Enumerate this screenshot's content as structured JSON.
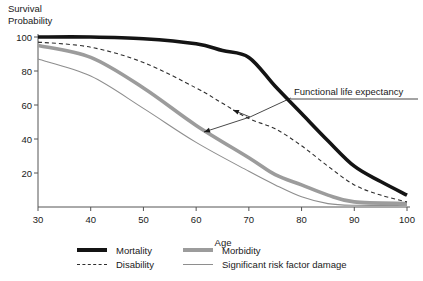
{
  "figure": {
    "y_axis_title_line1": "Survival",
    "y_axis_title_line2": "Probability",
    "x_axis_title": "Age",
    "background": "#ffffff"
  },
  "colors": {
    "axis": "#555555",
    "tick_label": "#1a1a1a",
    "annotation": "#1a1a1a"
  },
  "chart_data": {
    "type": "line",
    "title": "",
    "xlabel": "Age",
    "ylabel": "Survival Probability",
    "xlim": [
      30,
      100
    ],
    "ylim": [
      0,
      100
    ],
    "x_ticks": [
      30,
      40,
      50,
      60,
      70,
      80,
      90,
      100
    ],
    "y_ticks": [
      20,
      40,
      60,
      80,
      100
    ],
    "grid": false,
    "legend_position": "bottom",
    "series": [
      {
        "name": "Significant risk factor damage",
        "color": "#8e8e8e",
        "stroke_width": 1.1,
        "dash": null,
        "points": [
          [
            30,
            87
          ],
          [
            40,
            77
          ],
          [
            50,
            58
          ],
          [
            60,
            38
          ],
          [
            70,
            21
          ],
          [
            75,
            13
          ],
          [
            80,
            6
          ],
          [
            85,
            2
          ],
          [
            90,
            1
          ],
          [
            100,
            1
          ]
        ]
      },
      {
        "name": "Morbidity",
        "color": "#9c9c9c",
        "stroke_width": 3.6,
        "dash": null,
        "points": [
          [
            30,
            95
          ],
          [
            40,
            88
          ],
          [
            50,
            70
          ],
          [
            60,
            48
          ],
          [
            70,
            29
          ],
          [
            75,
            19
          ],
          [
            80,
            13
          ],
          [
            85,
            7
          ],
          [
            90,
            3
          ],
          [
            100,
            2
          ]
        ]
      },
      {
        "name": "Disability",
        "color": "#2e2e2e",
        "stroke_width": 1.1,
        "dash": "4,3",
        "points": [
          [
            30,
            97
          ],
          [
            40,
            94
          ],
          [
            50,
            85
          ],
          [
            60,
            70
          ],
          [
            65,
            61
          ],
          [
            70,
            52
          ],
          [
            75,
            46
          ],
          [
            80,
            36
          ],
          [
            85,
            24
          ],
          [
            90,
            13
          ],
          [
            95,
            7
          ],
          [
            100,
            3
          ]
        ]
      },
      {
        "name": "Mortality",
        "color": "#141414",
        "stroke_width": 3.6,
        "dash": null,
        "points": [
          [
            30,
            100
          ],
          [
            40,
            100
          ],
          [
            50,
            99
          ],
          [
            60,
            96
          ],
          [
            65,
            92
          ],
          [
            70,
            88
          ],
          [
            75,
            71
          ],
          [
            80,
            55
          ],
          [
            85,
            39
          ],
          [
            90,
            24
          ],
          [
            95,
            15
          ],
          [
            100,
            7
          ]
        ]
      }
    ],
    "annotation": {
      "text": "Functional life expectancy",
      "text_x": 294,
      "text_baseline_y": 95,
      "underline": {
        "x1": 291,
        "x2": 418,
        "y": 99
      },
      "leader": {
        "x1": 291,
        "y1": 98,
        "x2": 250,
        "y2": 117
      },
      "arrows": [
        {
          "x1": 250,
          "y1": 117,
          "x2": 233,
          "y2": 110
        },
        {
          "x1": 250,
          "y1": 117,
          "x2": 204,
          "y2": 132
        }
      ]
    }
  },
  "legend": {
    "columns": [
      {
        "items": [
          "Mortality",
          "Disability"
        ]
      },
      {
        "items": [
          "Morbidity",
          "Significant risk factor damage"
        ]
      }
    ]
  }
}
